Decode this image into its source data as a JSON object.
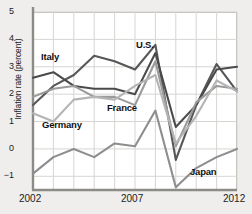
{
  "chart_data": {
    "type": "line",
    "title": "",
    "xlabel": "",
    "ylabel": "Inflation rate (percent)",
    "x": [
      2002,
      2003,
      2004,
      2005,
      2006,
      2007,
      2008,
      2009,
      2010,
      2011,
      2012
    ],
    "xlim": [
      2002,
      2012
    ],
    "ylim": [
      -1.5,
      5
    ],
    "xticks": [
      "2002",
      "2007",
      "2012"
    ],
    "yticks": [
      "5",
      "4",
      "3",
      "2",
      "1",
      "0",
      "-1"
    ],
    "grid": true,
    "legend_position": "inline-annotations",
    "series": [
      {
        "name": "U.S.",
        "color": "#575757",
        "label_x": 136,
        "label_y": 40,
        "values": [
          1.6,
          2.3,
          2.7,
          3.4,
          3.2,
          2.9,
          3.8,
          -0.4,
          1.6,
          3.1,
          2.1
        ]
      },
      {
        "name": "Italy",
        "color": "#4a4a4a",
        "label_x": 41,
        "label_y": 52,
        "values": [
          2.6,
          2.8,
          2.3,
          2.2,
          2.2,
          2.0,
          3.5,
          0.8,
          1.6,
          2.9,
          3.0
        ]
      },
      {
        "name": "France",
        "color": "#9a9a9a",
        "label_x": 107,
        "label_y": 103,
        "values": [
          1.9,
          2.2,
          2.3,
          1.9,
          1.9,
          1.6,
          3.2,
          0.1,
          1.7,
          2.3,
          2.2
        ]
      },
      {
        "name": "Germany",
        "color": "#b4b4b4",
        "label_x": 42,
        "label_y": 120,
        "values": [
          1.3,
          1.0,
          1.8,
          1.9,
          1.8,
          2.3,
          2.7,
          0.2,
          1.2,
          2.5,
          2.1
        ]
      },
      {
        "name": "Japan",
        "color": "#8e8e8e",
        "label_x": 190,
        "label_y": 167,
        "values": [
          -0.9,
          -0.3,
          0.0,
          -0.3,
          0.2,
          0.1,
          1.4,
          -1.4,
          -0.7,
          -0.3,
          0.0
        ]
      }
    ]
  }
}
